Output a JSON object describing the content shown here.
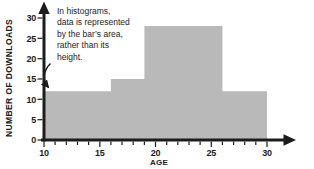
{
  "colors": {
    "bar_fill": "#b9b9b9",
    "axis": "#1c1c1c",
    "text": "#1c1c1c",
    "background": "#ffffff"
  },
  "chart_data": {
    "type": "histogram",
    "title": "",
    "xlabel": "AGE",
    "ylabel": "NUMBER OF DOWNLOADS",
    "x_range": [
      10,
      30
    ],
    "y_range": [
      0,
      30
    ],
    "x_major_ticks": [
      10,
      15,
      20,
      25,
      30
    ],
    "x_minor_tick_step": 1,
    "y_ticks": [
      0,
      5,
      10,
      15,
      20,
      25,
      30
    ],
    "grid": false,
    "legend": null,
    "bins": [
      {
        "age_from": 10,
        "age_to": 16,
        "bar_height": 12
      },
      {
        "age_from": 16,
        "age_to": 19,
        "bar_height": 15
      },
      {
        "age_from": 19,
        "age_to": 26,
        "bar_height": 28
      },
      {
        "age_from": 26,
        "age_to": 30,
        "bar_height": 12
      }
    ],
    "annotation": "In histograms,\ndata is represented\nby the bar’s area,\nrather than its\nheight."
  }
}
